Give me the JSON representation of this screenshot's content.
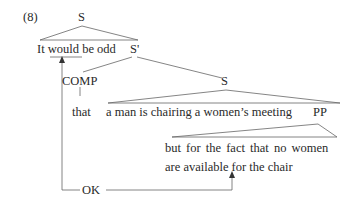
{
  "example_number": "(8)",
  "nodes": {
    "root": "S",
    "s_bar": "S'",
    "comp": "COMP",
    "embedded_s": "S",
    "pp": "PP"
  },
  "text": {
    "matrix_clause": "It would be odd",
    "complementizer": "that",
    "embedded_clause": "a man is chairing a women’s meeting",
    "pp_line1": "but for the fact that no women",
    "pp_line2": "are available for the chair"
  },
  "arrow_label": "OK",
  "colors": {
    "line": "#555555",
    "text": "#2a2a2a"
  }
}
